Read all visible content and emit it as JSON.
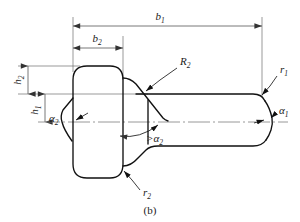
{
  "figure": {
    "caption": "(b)",
    "type": "engineering-drawing",
    "colors": {
      "outline": "#111111",
      "dimension": "#555555",
      "thin_line": "#6e6e6e",
      "centerline": "#777777",
      "background": "#ffffff",
      "text": "#1a1a1a"
    },
    "dimensions": [
      {
        "id": "b1",
        "symbol": "b",
        "subscript": "1",
        "label": "b₁",
        "orientation": "horizontal",
        "position": "top",
        "description": "overall length of body"
      },
      {
        "id": "b2",
        "symbol": "b",
        "subscript": "2",
        "label": "b₂",
        "orientation": "horizontal",
        "position": "upper-left",
        "description": "length of head section"
      },
      {
        "id": "h2",
        "symbol": "h",
        "subscript": "2",
        "label": "h₂",
        "orientation": "vertical",
        "position": "left-upper",
        "description": "height from shank top to head top"
      },
      {
        "id": "h1",
        "symbol": "h",
        "subscript": "1",
        "label": "h₁",
        "orientation": "vertical",
        "position": "left-lower",
        "description": "height from axis to shank top"
      }
    ],
    "annotations": [
      {
        "id": "R2",
        "symbol": "R",
        "subscript": "2",
        "label": "R₂",
        "kind": "radius-leader",
        "position": "upper-middle",
        "description": "radius at head-to-cone shoulder"
      },
      {
        "id": "r1",
        "symbol": "r",
        "subscript": "1",
        "label": "r₁",
        "kind": "radius-leader",
        "position": "upper-right",
        "description": "radius at right end chamfer"
      },
      {
        "id": "r2",
        "symbol": "r",
        "subscript": "2",
        "label": "r₂",
        "kind": "radius-leader",
        "position": "lower-middle",
        "description": "radius at lower head fillet"
      },
      {
        "id": "alpha1",
        "symbol": "α",
        "subscript": "1",
        "label": "α₁",
        "kind": "angle",
        "position": "right",
        "description": "included chamfer angle at right end"
      },
      {
        "id": "alpha2_left",
        "symbol": "α",
        "subscript": "2",
        "label": "α₂",
        "kind": "angle",
        "position": "left",
        "description": "taper angle at left end"
      },
      {
        "id": "alpha2_center",
        "symbol": ">α",
        "subscript": "2",
        "label": ">α₂",
        "kind": "angle-condition",
        "position": "center",
        "description": "cone angle greater than alpha 2"
      }
    ]
  }
}
